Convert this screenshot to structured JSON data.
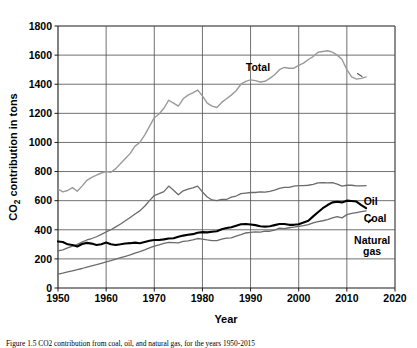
{
  "figure": {
    "caption": "Figure 1.5   CO2 contribution from coal, oil, and natural gas, for the years 1950-2015"
  },
  "chart_data": {
    "type": "line",
    "title": "",
    "xlabel": "Year",
    "ylabel": "CO2 contribution in tons",
    "ylabel_display": "CO₂ contribution in tons",
    "xlim": [
      1950,
      2020
    ],
    "ylim": [
      0,
      1800
    ],
    "xticks": [
      1950,
      1960,
      1970,
      1980,
      1990,
      2000,
      2010,
      2020
    ],
    "yticks": [
      0,
      200,
      400,
      600,
      800,
      1000,
      1200,
      1400,
      1600,
      1800
    ],
    "grid": true,
    "legend_position": "inline-right-labels",
    "series": [
      {
        "name": "Total",
        "label": "Total",
        "color": "#9a9a9a",
        "width": 1.4,
        "label_x": 1989,
        "label_y": 1490,
        "x": [
          1950,
          1951,
          1952,
          1953,
          1954,
          1955,
          1956,
          1957,
          1958,
          1959,
          1960,
          1961,
          1962,
          1963,
          1964,
          1965,
          1966,
          1967,
          1968,
          1969,
          1970,
          1971,
          1972,
          1973,
          1974,
          1975,
          1976,
          1977,
          1978,
          1979,
          1980,
          1981,
          1982,
          1983,
          1984,
          1985,
          1986,
          1987,
          1988,
          1989,
          1990,
          1991,
          1992,
          1993,
          1994,
          1995,
          1996,
          1997,
          1998,
          1999,
          2000,
          2001,
          2002,
          2003,
          2004,
          2005,
          2006,
          2007,
          2008,
          2009,
          2010,
          2011,
          2012,
          2013,
          2014
        ],
        "y": [
          680,
          660,
          670,
          690,
          665,
          700,
          740,
          760,
          775,
          790,
          800,
          795,
          820,
          855,
          890,
          925,
          975,
          1000,
          1050,
          1110,
          1170,
          1195,
          1235,
          1290,
          1270,
          1250,
          1300,
          1325,
          1340,
          1360,
          1320,
          1270,
          1250,
          1240,
          1275,
          1300,
          1325,
          1355,
          1400,
          1420,
          1430,
          1425,
          1415,
          1420,
          1440,
          1465,
          1500,
          1515,
          1510,
          1510,
          1530,
          1545,
          1570,
          1590,
          1620,
          1625,
          1630,
          1620,
          1600,
          1570,
          1500,
          1450,
          1435,
          1440,
          1450
        ]
      },
      {
        "name": "Oil",
        "label": "Oil",
        "color": "#6b6b6b",
        "width": 1.3,
        "label_x": 2013.5,
        "label_y": 572,
        "x": [
          1950,
          1951,
          1952,
          1953,
          1954,
          1955,
          1956,
          1957,
          1958,
          1959,
          1960,
          1961,
          1962,
          1963,
          1964,
          1965,
          1966,
          1967,
          1968,
          1969,
          1970,
          1971,
          1972,
          1973,
          1974,
          1975,
          1976,
          1977,
          1978,
          1979,
          1980,
          1981,
          1982,
          1983,
          1984,
          1985,
          1986,
          1987,
          1988,
          1989,
          1990,
          1991,
          1992,
          1993,
          1994,
          1995,
          1996,
          1997,
          1998,
          1999,
          2000,
          2001,
          2002,
          2003,
          2004,
          2005,
          2006,
          2007,
          2008,
          2009,
          2010,
          2011,
          2012,
          2013,
          2014
        ],
        "y": [
          255,
          262,
          275,
          288,
          300,
          315,
          330,
          340,
          352,
          368,
          385,
          400,
          420,
          440,
          462,
          485,
          508,
          530,
          562,
          600,
          635,
          648,
          662,
          700,
          672,
          640,
          668,
          680,
          688,
          700,
          660,
          625,
          605,
          600,
          608,
          608,
          624,
          632,
          648,
          652,
          656,
          656,
          660,
          658,
          664,
          672,
          684,
          692,
          692,
          700,
          704,
          704,
          706,
          712,
          722,
          724,
          722,
          724,
          714,
          700,
          706,
          706,
          702,
          702,
          704
        ]
      },
      {
        "name": "Coal",
        "label": "Coal",
        "color": "#000000",
        "width": 2.1,
        "label_x": 2013.5,
        "label_y": 452,
        "x": [
          1950,
          1951,
          1952,
          1953,
          1954,
          1955,
          1956,
          1957,
          1958,
          1959,
          1960,
          1961,
          1962,
          1963,
          1964,
          1965,
          1966,
          1967,
          1968,
          1969,
          1970,
          1971,
          1972,
          1973,
          1974,
          1975,
          1976,
          1977,
          1978,
          1979,
          1980,
          1981,
          1982,
          1983,
          1984,
          1985,
          1986,
          1987,
          1988,
          1989,
          1990,
          1991,
          1992,
          1993,
          1994,
          1995,
          1996,
          1997,
          1998,
          1999,
          2000,
          2001,
          2002,
          2003,
          2004,
          2005,
          2006,
          2007,
          2008,
          2009,
          2010,
          2011,
          2012,
          2013,
          2014
        ],
        "y": [
          320,
          316,
          300,
          296,
          285,
          302,
          310,
          305,
          296,
          300,
          312,
          300,
          296,
          300,
          306,
          308,
          312,
          308,
          316,
          324,
          330,
          330,
          334,
          340,
          342,
          352,
          360,
          366,
          370,
          380,
          384,
          382,
          386,
          390,
          404,
          412,
          418,
          428,
          438,
          440,
          436,
          432,
          424,
          422,
          424,
          432,
          440,
          440,
          434,
          434,
          438,
          450,
          462,
          492,
          520,
          548,
          570,
          588,
          592,
          588,
          600,
          598,
          594,
          570,
          548
        ]
      },
      {
        "name": "Natural gas",
        "label": "Natural gas",
        "label_line1": "Natural",
        "label_line2": "gas",
        "color": "#6b6b6b",
        "width": 1.3,
        "label_x": 2011.5,
        "label_y": 300,
        "x": [
          1950,
          1951,
          1952,
          1953,
          1954,
          1955,
          1956,
          1957,
          1958,
          1959,
          1960,
          1961,
          1962,
          1963,
          1964,
          1965,
          1966,
          1967,
          1968,
          1969,
          1970,
          1971,
          1972,
          1973,
          1974,
          1975,
          1976,
          1977,
          1978,
          1979,
          1980,
          1981,
          1982,
          1983,
          1984,
          1985,
          1986,
          1987,
          1988,
          1989,
          1990,
          1991,
          1992,
          1993,
          1994,
          1995,
          1996,
          1997,
          1998,
          1999,
          2000,
          2001,
          2002,
          2003,
          2004,
          2005,
          2006,
          2007,
          2008,
          2009,
          2010,
          2011,
          2012,
          2013,
          2014
        ],
        "y": [
          95,
          102,
          110,
          118,
          126,
          134,
          144,
          152,
          160,
          170,
          180,
          188,
          198,
          208,
          218,
          228,
          240,
          250,
          262,
          276,
          288,
          296,
          306,
          314,
          312,
          310,
          320,
          324,
          330,
          340,
          336,
          330,
          326,
          326,
          336,
          342,
          344,
          356,
          366,
          378,
          382,
          386,
          384,
          390,
          390,
          398,
          412,
          408,
          414,
          418,
          424,
          428,
          436,
          448,
          456,
          462,
          470,
          482,
          490,
          482,
          504,
          512,
          518,
          524,
          530
        ]
      }
    ]
  }
}
